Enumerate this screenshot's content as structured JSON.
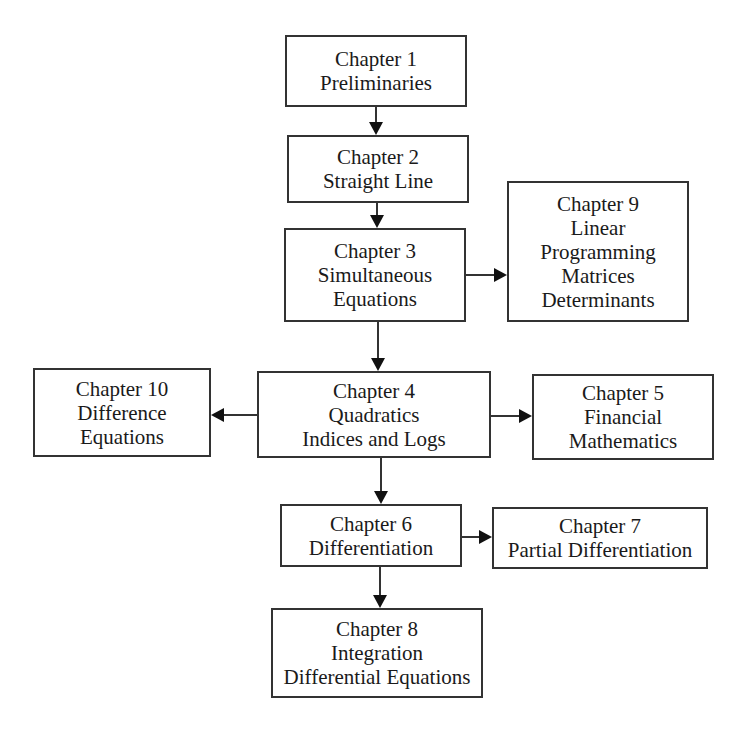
{
  "diagram": {
    "type": "flowchart",
    "nodes": [
      {
        "id": "ch1",
        "lines": [
          "Chapter 1",
          "Preliminaries"
        ],
        "box": [
          285,
          35,
          182,
          72
        ]
      },
      {
        "id": "ch2",
        "lines": [
          "Chapter 2",
          "Straight Line"
        ],
        "box": [
          287,
          135,
          182,
          68
        ]
      },
      {
        "id": "ch3",
        "lines": [
          "Chapter 3",
          "Simultaneous",
          "Equations"
        ],
        "box": [
          284,
          228,
          182,
          94
        ]
      },
      {
        "id": "ch9",
        "lines": [
          "Chapter 9",
          "Linear",
          "Programming",
          "Matrices",
          "Determinants"
        ],
        "box": [
          507,
          181,
          182,
          141
        ]
      },
      {
        "id": "ch4",
        "lines": [
          "Chapter 4",
          "Quadratics",
          "Indices and Logs"
        ],
        "box": [
          257,
          371,
          234,
          87
        ]
      },
      {
        "id": "ch10",
        "lines": [
          "Chapter 10",
          "Difference",
          "Equations"
        ],
        "box": [
          33,
          368,
          178,
          89
        ]
      },
      {
        "id": "ch5",
        "lines": [
          "Chapter 5",
          "Financial",
          "Mathematics"
        ],
        "box": [
          532,
          374,
          182,
          86
        ]
      },
      {
        "id": "ch6",
        "lines": [
          "Chapter 6",
          "Differentiation"
        ],
        "box": [
          280,
          504,
          182,
          63
        ]
      },
      {
        "id": "ch7",
        "lines": [
          "Chapter 7",
          "Partial Differentiation"
        ],
        "box": [
          492,
          507,
          216,
          62
        ]
      },
      {
        "id": "ch8",
        "lines": [
          "Chapter 8",
          "Integration",
          "Differential Equations"
        ],
        "box": [
          271,
          608,
          212,
          90
        ]
      }
    ],
    "edges": [
      {
        "from": "ch1",
        "to": "ch2",
        "path": [
          [
            376,
            107
          ],
          [
            376,
            135
          ]
        ]
      },
      {
        "from": "ch2",
        "to": "ch3",
        "path": [
          [
            377,
            203
          ],
          [
            377,
            228
          ]
        ]
      },
      {
        "from": "ch3",
        "to": "ch9",
        "path": [
          [
            466,
            275
          ],
          [
            507,
            275
          ]
        ]
      },
      {
        "from": "ch3",
        "to": "ch4",
        "path": [
          [
            378,
            322
          ],
          [
            378,
            371
          ]
        ]
      },
      {
        "from": "ch4",
        "to": "ch10",
        "path": [
          [
            257,
            415
          ],
          [
            211,
            415
          ]
        ]
      },
      {
        "from": "ch4",
        "to": "ch5",
        "path": [
          [
            491,
            416
          ],
          [
            532,
            416
          ]
        ]
      },
      {
        "from": "ch4",
        "to": "ch6",
        "path": [
          [
            381,
            458
          ],
          [
            381,
            504
          ]
        ]
      },
      {
        "from": "ch6",
        "to": "ch7",
        "path": [
          [
            462,
            537
          ],
          [
            492,
            537
          ]
        ]
      },
      {
        "from": "ch6",
        "to": "ch8",
        "path": [
          [
            380,
            567
          ],
          [
            380,
            608
          ]
        ]
      }
    ],
    "colors": {
      "stroke": "#333333",
      "text": "#1a1a1a",
      "background": "#ffffff"
    }
  }
}
